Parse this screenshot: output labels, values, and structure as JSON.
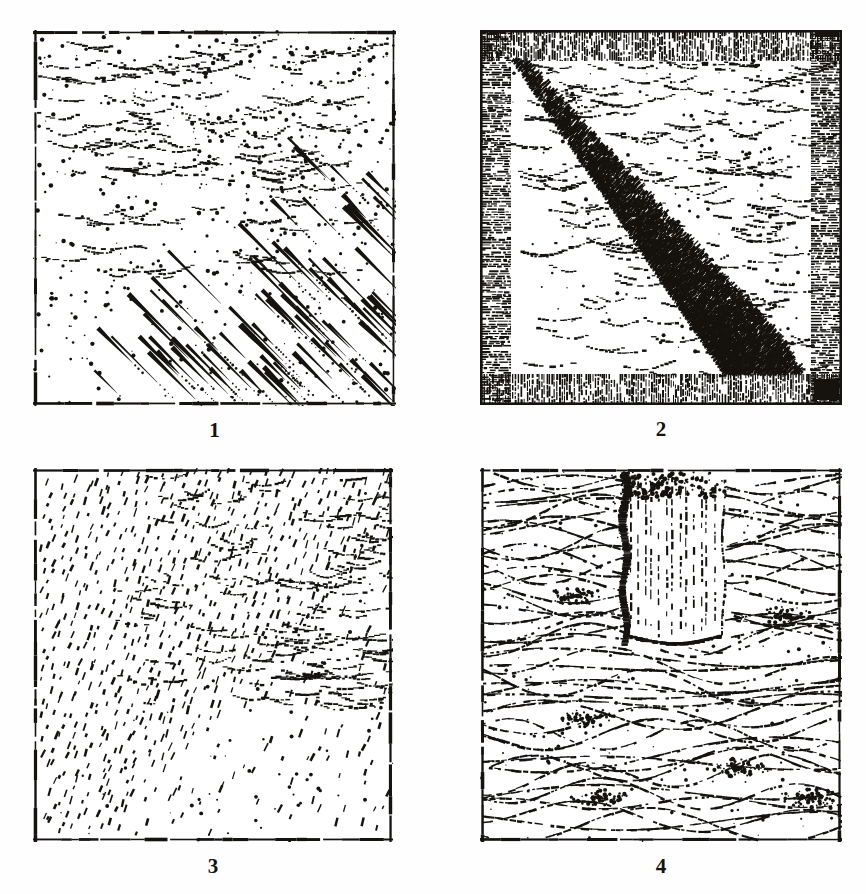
{
  "plate": {
    "medium": "engraved line-and-stipple hachure drawing, scanned from print",
    "background_color": "#fefefe",
    "ink_color": "#16130f",
    "layout": "2x2 grid of square figures with numeral captions beneath each",
    "figures": [
      {
        "id": "figure-1",
        "caption": "1",
        "frame_style": "thin broken single rule",
        "terrain_description": "stippled slope with tapered comet-shaped hachure strokes",
        "upper_region": "fine stipple dots with short wavy contour flecks",
        "lower_region": "bold tapered teardrop hachures running upper-left to lower-right",
        "hachure_angle_deg": 135,
        "hachure_count": 86,
        "stipple_count": 900,
        "contour_flecks": 150
      },
      {
        "id": "figure-2",
        "caption": "2",
        "frame_style": "wide hatched border band, vertical ruling top and bottom, horizontal ruling left and right",
        "terrain_description": "dense diagonal line hatching filling lower-left triangle, open stippled contours upper-right",
        "border_band_px": 30,
        "hatch_angle_deg": 135,
        "hatch_line_count": 150,
        "contour_flecks": 230
      },
      {
        "id": "figure-3",
        "caption": "3",
        "frame_style": "thin broken single rule",
        "terrain_description": "uniform field of short diagonal dash hachures with contour-fleck texture along the upper right",
        "dash_angle_deg": 115,
        "dash_rows": 34,
        "dash_per_row": 30,
        "contour_flecks": 200
      },
      {
        "id": "figure-4",
        "caption": "4",
        "frame_style": "thin broken single rule",
        "terrain_description": "flowing contour-line terrain interrupted by a deep vertical cut or trough in the upper middle",
        "notch": {
          "shape": "vertical trough with heavy dark left wall and rounded base",
          "x_fraction": 0.4,
          "width_fraction": 0.27,
          "depth_fraction": 0.47
        },
        "contour_lines": 46
      }
    ]
  }
}
